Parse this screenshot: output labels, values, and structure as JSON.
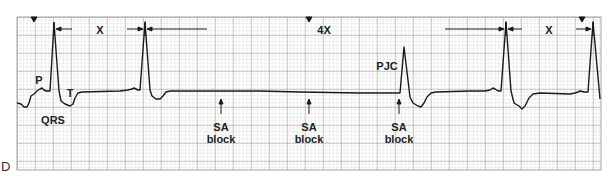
{
  "panel_label": "D",
  "strip": {
    "grid": {
      "left": 17,
      "top": 17,
      "right": 601,
      "bottom": 170,
      "small": 3.6,
      "major": 18,
      "minor_color": "#c8c8c8",
      "major_color": "#8a8a8a",
      "bg": "#ffffff"
    },
    "trace_color": "#1a1a1a"
  },
  "labels": {
    "p": "P",
    "t": "T",
    "qrs": "QRS",
    "pjc": "PJC",
    "interval_x1": "X",
    "interval_4x": "4X",
    "interval_x2": "X",
    "sa_block_1": {
      "line1": "SA",
      "line2": "block"
    },
    "sa_block_2": {
      "line1": "SA",
      "line2": "block"
    },
    "sa_block_3": {
      "line1": "SA",
      "line2": "block"
    }
  },
  "markers": {
    "triangle_positions_x": [
      34,
      309,
      582
    ]
  }
}
